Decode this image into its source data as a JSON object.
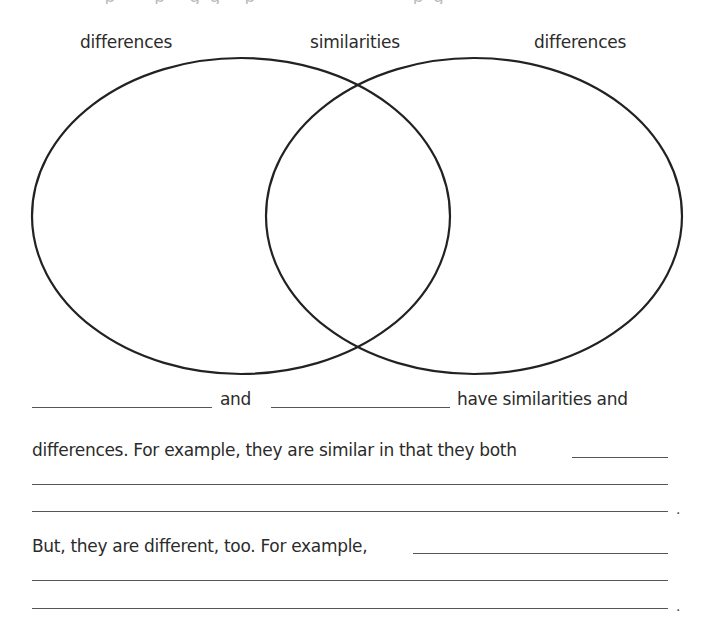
{
  "worksheet": {
    "top_cropped_text": "· · ·  p  ·  · p · g  g · p · ·  · ·  · · · · ·  · p g ·",
    "venn": {
      "labels": {
        "left": "differences",
        "center": "similarities",
        "right": "differences"
      },
      "left_circle": {
        "cx": 241,
        "cy": 216,
        "rx": 209,
        "ry": 158
      },
      "right_circle": {
        "cx": 474,
        "cy": 216,
        "rx": 208,
        "ry": 158
      },
      "stroke_color": "#222222"
    },
    "paragraph": {
      "line1_and": "and",
      "line1_end": "have similarities and",
      "line2": "differences. For example, they are similar in that they both",
      "period1": ".",
      "line5": "But, they are different, too. For example,",
      "period2": "."
    },
    "blanks": [
      {
        "id": "subject-1",
        "value": ""
      },
      {
        "id": "subject-2",
        "value": ""
      },
      {
        "id": "similarity-1",
        "value": ""
      },
      {
        "id": "similarity-2",
        "value": ""
      },
      {
        "id": "similarity-3",
        "value": ""
      },
      {
        "id": "difference-1",
        "value": ""
      },
      {
        "id": "difference-2",
        "value": ""
      },
      {
        "id": "difference-3",
        "value": ""
      }
    ]
  }
}
